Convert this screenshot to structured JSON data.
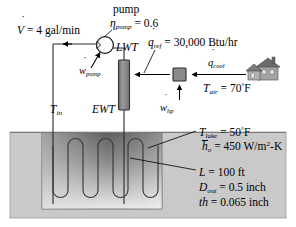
{
  "figure": {
    "colors": {
      "line": "#000000",
      "ground_fill": "#c8c8c8",
      "lake_dark": "#6f6f6f",
      "lake_light": "#e2e2e2",
      "component_fill": "#8c8c8c",
      "house_body": "#9a9a9a",
      "house_roof": "#6e6e6e",
      "background": "#ffffff"
    }
  },
  "labels": {
    "volume_flow": {
      "symbol": "V",
      "accent": "dot",
      "equals": "=",
      "value": "4",
      "units": "gal/min"
    },
    "pump_title": "pump",
    "pump_efficiency": {
      "symbol": "η",
      "subscript": "pump",
      "equals": "=",
      "value": "0.6"
    },
    "leaving_water_temp": "LWT",
    "entering_water_temp": "EWT",
    "q_refrigeration": {
      "symbol": "q",
      "accent": "dot",
      "subscript": "ref",
      "equals": "=",
      "value": "30,000",
      "units": "Btu/hr"
    },
    "w_pump": {
      "symbol": "w",
      "accent": "dot",
      "subscript": "pump"
    },
    "q_cool": {
      "symbol": "q",
      "accent": "dot",
      "subscript": "cool"
    },
    "w_heatpump": {
      "symbol": "w",
      "accent": "dot",
      "subscript": "hp"
    },
    "t_air": {
      "symbol": "T",
      "subscript": "air",
      "equals": "=",
      "value": "70",
      "degree": "°",
      "unit": "F"
    },
    "t_in": {
      "symbol": "T",
      "subscript": "in"
    },
    "t_lake": {
      "symbol": "T",
      "subscript": "lake",
      "equals": "=",
      "value": "50",
      "degree": "°",
      "unit": "F"
    },
    "h_outer": {
      "symbol": "h",
      "accent": "bar",
      "subscript": "o",
      "equals": "=",
      "value": "450",
      "units": "W/m",
      "exponent": "2",
      "units_tail": "-K"
    },
    "pipe_length": {
      "symbol": "L",
      "equals": "=",
      "value": "100",
      "units": "ft"
    },
    "pipe_outer_diameter": {
      "symbol": "D",
      "subscript": "out",
      "equals": "=",
      "value": "0.5",
      "units": "inch"
    },
    "pipe_thickness": {
      "symbol": "th",
      "equals": "=",
      "value": "0.065",
      "units": "inch"
    }
  },
  "components": {
    "pump": "pump-symbol",
    "heat_exchanger": "vertical-heat-exchanger",
    "heat_pump_unit": "heat-pump-box",
    "house": "house-icon",
    "ground": "ground-region",
    "lake": "lake-region",
    "coil": "serpentine-ground-coil"
  }
}
